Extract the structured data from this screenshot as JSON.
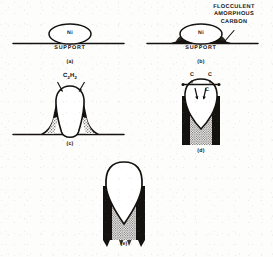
{
  "figure": {
    "background_color": "#fdfdfc",
    "ink_color": "#14120f",
    "panels": [
      {
        "id": "a",
        "caption": "(a)",
        "description": "Nickel catalyst particle resting on a flat support surface",
        "labels": {
          "particle": "Ni",
          "support": "SUPPORT"
        }
      },
      {
        "id": "b",
        "caption": "(b)",
        "description": "Nickel particle on support with flocculent amorphous carbon deposited around its base",
        "labels": {
          "particle": "Ni",
          "support": "SUPPORT",
          "annotation_line1": "FLOCCULENT",
          "annotation_line2": "AMORPHOUS",
          "annotation_line3": "CARBON"
        }
      },
      {
        "id": "c",
        "caption": "(c)",
        "description": "Acetylene adsorbs on the nickel particle, which is lifted from the support as a filament begins to grow beneath it",
        "labels": {
          "reactant": "C2H2",
          "reactant_html": "C₂H₂"
        }
      },
      {
        "id": "d",
        "caption": "(d)",
        "description": "Carbon diffuses through the nickel particle and precipitates to extend the hollow filament",
        "labels": {
          "carbon_left": "C",
          "carbon_right": "C",
          "carbon_inner": "C"
        }
      },
      {
        "id": "e",
        "caption": "(e)",
        "description": "Fully grown carbon filament with the nickel particle carried at the tip"
      }
    ]
  }
}
